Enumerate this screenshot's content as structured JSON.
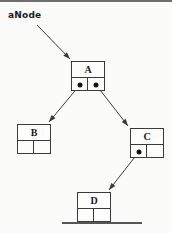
{
  "diagram": {
    "title_label": "aNode",
    "kind": "binary-tree-node-pointer-diagram",
    "background_color": "#fbfbfa",
    "line_color": "#3a3a3a",
    "dot_color": "#121212",
    "nodes": [
      {
        "id": "A",
        "label": "A",
        "x": 71,
        "y": 61,
        "w": 34,
        "h": 30,
        "left_pointer": "filled",
        "right_pointer": "filled"
      },
      {
        "id": "B",
        "label": "B",
        "x": 17,
        "y": 124,
        "w": 34,
        "h": 30,
        "left_pointer": "null",
        "right_pointer": "null"
      },
      {
        "id": "C",
        "label": "C",
        "x": 130,
        "y": 128,
        "w": 34,
        "h": 30,
        "left_pointer": "filled",
        "right_pointer": "null"
      },
      {
        "id": "D",
        "label": "D",
        "x": 77,
        "y": 192,
        "w": 34,
        "h": 30,
        "left_pointer": "null",
        "right_pointer": "null"
      }
    ],
    "arrows": [
      {
        "name": "anode-to-A",
        "from": [
          37,
          25
        ],
        "to": [
          70,
          59
        ]
      },
      {
        "name": "A-left-to-B",
        "from": [
          79,
          86
        ],
        "to": [
          49,
          122
        ]
      },
      {
        "name": "A-right-to-C",
        "from": [
          97,
          86
        ],
        "to": [
          128,
          126
        ]
      },
      {
        "name": "C-left-to-D",
        "from": [
          138,
          153
        ],
        "to": [
          109,
          190
        ]
      }
    ]
  }
}
